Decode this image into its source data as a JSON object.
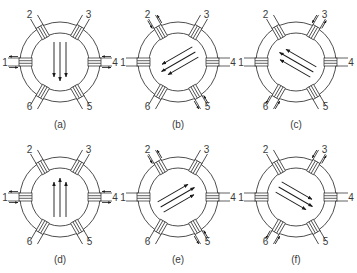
{
  "figure": {
    "colors": {
      "line": "#3a3a3a",
      "arrow": "#1a1a1a",
      "background": "#ffffff"
    },
    "slot_labels": [
      "1",
      "2",
      "3",
      "4",
      "5",
      "6"
    ],
    "panels": [
      {
        "id": "a",
        "caption": "(a)",
        "cx": 60,
        "cy": 62,
        "energized_slots": [
          "1",
          "4"
        ],
        "field_angle_deg": 90,
        "field_direction": "down"
      },
      {
        "id": "b",
        "caption": "(b)",
        "cx": 178,
        "cy": 62,
        "energized_slots": [
          "2",
          "5"
        ],
        "field_angle_deg": 150,
        "field_direction": "down-left"
      },
      {
        "id": "c",
        "caption": "(c)",
        "cx": 296,
        "cy": 62,
        "energized_slots": [
          "3",
          "6"
        ],
        "field_angle_deg": -150,
        "field_direction": "up-left"
      },
      {
        "id": "d",
        "caption": "(d)",
        "cx": 60,
        "cy": 197,
        "energized_slots": [
          "1",
          "4"
        ],
        "field_angle_deg": -90,
        "field_direction": "up"
      },
      {
        "id": "e",
        "caption": "(e)",
        "cx": 178,
        "cy": 197,
        "energized_slots": [
          "2",
          "5"
        ],
        "field_angle_deg": -30,
        "field_direction": "up-right"
      },
      {
        "id": "f",
        "caption": "(f)",
        "cx": 296,
        "cy": 197,
        "energized_slots": [
          "3",
          "6"
        ],
        "field_angle_deg": 30,
        "field_direction": "down-right"
      }
    ]
  }
}
